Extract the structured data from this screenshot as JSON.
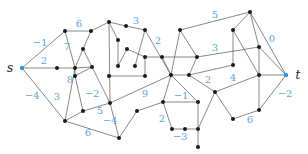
{
  "diagram": {
    "title": "",
    "colors": {
      "edge": "#555555",
      "node": "#1a1a1a",
      "terminal": "#3b8fd4",
      "weight": "#5aa5dc"
    },
    "terminals": [
      {
        "id": "s",
        "label": "s",
        "x": 22,
        "y": 68,
        "lx": 10,
        "ly": 72
      },
      {
        "id": "t",
        "label": "t",
        "x": 286,
        "y": 75,
        "lx": 298,
        "ly": 79
      }
    ],
    "nodes": [
      {
        "id": "n1",
        "x": 65,
        "y": 31
      },
      {
        "id": "n2",
        "x": 91,
        "y": 31
      },
      {
        "id": "n3",
        "x": 83,
        "y": 49
      },
      {
        "id": "n4",
        "x": 57,
        "y": 68
      },
      {
        "id": "n5",
        "x": 75,
        "y": 68
      },
      {
        "id": "n6",
        "x": 92,
        "y": 67
      },
      {
        "id": "n7",
        "x": 75,
        "y": 76
      },
      {
        "id": "n8",
        "x": 83,
        "y": 111
      },
      {
        "id": "n9",
        "x": 65,
        "y": 121
      },
      {
        "id": "n10",
        "x": 110,
        "y": 103
      },
      {
        "id": "n11",
        "x": 109,
        "y": 76
      },
      {
        "id": "n12",
        "x": 109,
        "y": 22
      },
      {
        "id": "n13",
        "x": 126,
        "y": 26
      },
      {
        "id": "n14",
        "x": 145,
        "y": 30
      },
      {
        "id": "n15",
        "x": 118,
        "y": 40
      },
      {
        "id": "n16",
        "x": 127,
        "y": 49
      },
      {
        "id": "n17",
        "x": 118,
        "y": 66
      },
      {
        "id": "n18",
        "x": 135,
        "y": 66
      },
      {
        "id": "n19",
        "x": 145,
        "y": 57
      },
      {
        "id": "n20",
        "x": 145,
        "y": 76
      },
      {
        "id": "n21",
        "x": 162,
        "y": 57
      },
      {
        "id": "n22",
        "x": 171,
        "y": 75
      },
      {
        "id": "n23",
        "x": 189,
        "y": 75
      },
      {
        "id": "n24",
        "x": 180,
        "y": 30
      },
      {
        "id": "n25",
        "x": 197,
        "y": 57
      },
      {
        "id": "n26",
        "x": 163,
        "y": 102
      },
      {
        "id": "n27",
        "x": 198,
        "y": 102
      },
      {
        "id": "n28",
        "x": 215,
        "y": 92
      },
      {
        "id": "n29",
        "x": 172,
        "y": 129
      },
      {
        "id": "n30",
        "x": 185,
        "y": 129
      },
      {
        "id": "n31",
        "x": 198,
        "y": 129
      },
      {
        "id": "n32",
        "x": 198,
        "y": 147
      },
      {
        "id": "n33",
        "x": 137,
        "y": 111
      },
      {
        "id": "n34",
        "x": 119,
        "y": 138
      },
      {
        "id": "n35",
        "x": 250,
        "y": 12
      },
      {
        "id": "n36",
        "x": 233,
        "y": 30
      },
      {
        "id": "n37",
        "x": 259,
        "y": 47
      },
      {
        "id": "n38",
        "x": 233,
        "y": 65
      },
      {
        "id": "n39",
        "x": 259,
        "y": 75
      },
      {
        "id": "n40",
        "x": 233,
        "y": 119
      },
      {
        "id": "n41",
        "x": 259,
        "y": 110
      }
    ],
    "edges": [
      {
        "a": "s",
        "b": "n1",
        "w": "−1",
        "wx": 40,
        "wy": 46
      },
      {
        "a": "s",
        "b": "n5",
        "w": "2",
        "wx": 44,
        "wy": 64
      },
      {
        "a": "s",
        "b": "n9",
        "w": "−4",
        "wx": 32,
        "wy": 99
      },
      {
        "a": "n1",
        "b": "n2",
        "w": "6",
        "wx": 79,
        "wy": 27
      },
      {
        "a": "n1",
        "b": "n5",
        "w": "7",
        "wx": 67,
        "wy": 50
      },
      {
        "a": "n2",
        "b": "n3",
        "w": "",
        "wx": 0,
        "wy": 0
      },
      {
        "a": "n2",
        "b": "n12",
        "w": "",
        "wx": 0,
        "wy": 0
      },
      {
        "a": "n3",
        "b": "n5",
        "w": "",
        "wx": 0,
        "wy": 0
      },
      {
        "a": "n3",
        "b": "n6",
        "w": "",
        "wx": 0,
        "wy": 0
      },
      {
        "a": "n5",
        "b": "n6",
        "w": "",
        "wx": 0,
        "wy": 0
      },
      {
        "a": "n5",
        "b": "n7",
        "w": "8",
        "wx": 70,
        "wy": 83
      },
      {
        "a": "n5",
        "b": "n9",
        "w": "3",
        "wx": 57,
        "wy": 100
      },
      {
        "a": "n6",
        "b": "n7",
        "w": "",
        "wx": 0,
        "wy": 0
      },
      {
        "a": "n6",
        "b": "n10",
        "w": "",
        "wx": 0,
        "wy": 0
      },
      {
        "a": "n7",
        "b": "n8",
        "w": "−2",
        "wx": 92,
        "wy": 97
      },
      {
        "a": "n8",
        "b": "n9",
        "w": "",
        "wx": 0,
        "wy": 0
      },
      {
        "a": "n8",
        "b": "n10",
        "w": "5",
        "wx": 100,
        "wy": 114
      },
      {
        "a": "n9",
        "b": "n34",
        "w": "6",
        "wx": 88,
        "wy": 136
      },
      {
        "a": "n10",
        "b": "n34",
        "w": "−4",
        "wx": 110,
        "wy": 124
      },
      {
        "a": "n10",
        "b": "n12",
        "w": "",
        "wx": 0,
        "wy": 0
      },
      {
        "a": "n10",
        "b": "n22",
        "w": "9",
        "wx": 145,
        "wy": 97
      },
      {
        "a": "n12",
        "b": "n13",
        "w": "",
        "wx": 0,
        "wy": 0
      },
      {
        "a": "n12",
        "b": "n15",
        "w": "",
        "wx": 0,
        "wy": 0
      },
      {
        "a": "n13",
        "b": "n14",
        "w": "3",
        "wx": 136,
        "wy": 24
      },
      {
        "a": "n14",
        "b": "n18",
        "w": "",
        "wx": 0,
        "wy": 0
      },
      {
        "a": "n14",
        "b": "n22",
        "w": "2",
        "wx": 158,
        "wy": 44
      },
      {
        "a": "n15",
        "b": "n17",
        "w": "",
        "wx": 0,
        "wy": 0
      },
      {
        "a": "n16",
        "b": "n17",
        "w": "",
        "wx": 0,
        "wy": 0
      },
      {
        "a": "n16",
        "b": "n19",
        "w": "",
        "wx": 0,
        "wy": 0
      },
      {
        "a": "n11",
        "b": "n20",
        "w": "",
        "wx": 0,
        "wy": 0
      },
      {
        "a": "n19",
        "b": "n20",
        "w": "",
        "wx": 0,
        "wy": 0
      },
      {
        "a": "n19",
        "b": "n21",
        "w": "",
        "wx": 0,
        "wy": 0
      },
      {
        "a": "n21",
        "b": "n25",
        "w": "",
        "wx": 0,
        "wy": 0
      },
      {
        "a": "n21",
        "b": "n22",
        "w": "",
        "wx": 0,
        "wy": 0
      },
      {
        "a": "n22",
        "b": "n23",
        "w": "",
        "wx": 0,
        "wy": 0
      },
      {
        "a": "n22",
        "b": "n24",
        "w": "",
        "wx": 0,
        "wy": 0
      },
      {
        "a": "n22",
        "b": "n26",
        "w": "",
        "wx": 0,
        "wy": 0
      },
      {
        "a": "n22",
        "b": "n27",
        "w": "−1",
        "wx": 181,
        "wy": 99
      },
      {
        "a": "n23",
        "b": "n25",
        "w": "",
        "wx": 0,
        "wy": 0
      },
      {
        "a": "n23",
        "b": "n28",
        "w": "2",
        "wx": 208,
        "wy": 83
      },
      {
        "a": "n23",
        "b": "n38",
        "w": "",
        "wx": 0,
        "wy": 0
      },
      {
        "a": "n24",
        "b": "n25",
        "w": "",
        "wx": 0,
        "wy": 0
      },
      {
        "a": "n24",
        "b": "n35",
        "w": "5",
        "wx": 215,
        "wy": 18
      },
      {
        "a": "n25",
        "b": "n37",
        "w": "3",
        "wx": 215,
        "wy": 51
      },
      {
        "a": "n26",
        "b": "n29",
        "w": "2",
        "wx": 162,
        "wy": 122
      },
      {
        "a": "n26",
        "b": "n33",
        "w": "",
        "wx": 0,
        "wy": 0
      },
      {
        "a": "n26",
        "b": "n27",
        "w": "",
        "wx": 0,
        "wy": 0
      },
      {
        "a": "n27",
        "b": "n31",
        "w": "",
        "wx": 0,
        "wy": 0
      },
      {
        "a": "n28",
        "b": "n31",
        "w": "",
        "wx": 0,
        "wy": 0
      },
      {
        "a": "n28",
        "b": "n39",
        "w": "4",
        "wx": 233,
        "wy": 81
      },
      {
        "a": "n28",
        "b": "n40",
        "w": "",
        "wx": 0,
        "wy": 0
      },
      {
        "a": "n29",
        "b": "n30",
        "w": "−3",
        "wx": 180,
        "wy": 140
      },
      {
        "a": "n30",
        "b": "n31",
        "w": "",
        "wx": 0,
        "wy": 0
      },
      {
        "a": "n31",
        "b": "n32",
        "w": "",
        "wx": 0,
        "wy": 0
      },
      {
        "a": "n33",
        "b": "n34",
        "w": "",
        "wx": 0,
        "wy": 0
      },
      {
        "a": "n35",
        "b": "n36",
        "w": "",
        "wx": 0,
        "wy": 0
      },
      {
        "a": "n35",
        "b": "n37",
        "w": "",
        "wx": 0,
        "wy": 0
      },
      {
        "a": "n35",
        "b": "t",
        "w": "0",
        "wx": 272,
        "wy": 42
      },
      {
        "a": "n36",
        "b": "n38",
        "w": "",
        "wx": 0,
        "wy": 0
      },
      {
        "a": "n36",
        "b": "n39",
        "w": "",
        "wx": 0,
        "wy": 0
      },
      {
        "a": "n37",
        "b": "n39",
        "w": "",
        "wx": 0,
        "wy": 0
      },
      {
        "a": "n37",
        "b": "t",
        "w": "",
        "wx": 0,
        "wy": 0
      },
      {
        "a": "n39",
        "b": "t",
        "w": "",
        "wx": 0,
        "wy": 0
      },
      {
        "a": "n39",
        "b": "n41",
        "w": "",
        "wx": 0,
        "wy": 0
      },
      {
        "a": "n40",
        "b": "n41",
        "w": "6",
        "wx": 250,
        "wy": 123
      },
      {
        "a": "n41",
        "b": "t",
        "w": "−2",
        "wx": 285,
        "wy": 97
      }
    ]
  }
}
